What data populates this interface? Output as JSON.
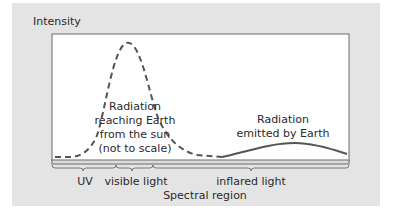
{
  "diagram": {
    "y_axis_label": "Intensity",
    "x_axis_label": "Spectral region",
    "regions": [
      {
        "label": "UV"
      },
      {
        "label": "visible light"
      },
      {
        "label": "inflared light"
      }
    ],
    "curves": [
      {
        "name": "sun",
        "style": "dashed",
        "label_lines": [
          "Radiation",
          "reaching Earth",
          "from the sun",
          "(not to scale)"
        ]
      },
      {
        "name": "earth",
        "style": "solid",
        "label_lines": [
          "Radiation",
          "emitted by Earth"
        ]
      }
    ],
    "colors": {
      "panel": "#e4e4e4",
      "plot": "#ffffff",
      "line": "#555555"
    }
  }
}
